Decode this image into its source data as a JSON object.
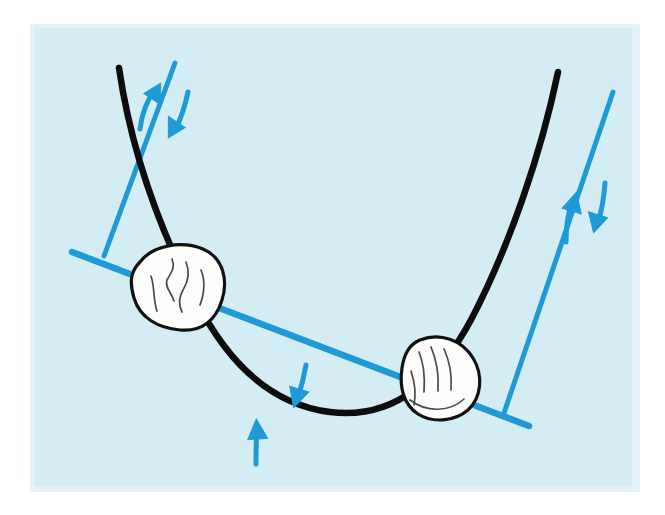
{
  "figure": {
    "title": "Hand-drawn diagram of a bead on a curved wire with two straight guide lines",
    "kind": "hand-drawn-geometry-sketch",
    "canvas": {
      "width": 665,
      "height": 515
    },
    "colors": {
      "page_background": "#ffffff",
      "panel_background": "#d7eef5",
      "curve_stroke": "#0d0d0d",
      "line_stroke": "#1f9ad6",
      "arrow_fill": "#1f9ad6",
      "bead_fill": "#fdfdfb",
      "bead_stroke": "#111111",
      "bead_detail_stroke": "#4a4a4a"
    },
    "panel": {
      "name": "paper-panel",
      "x": 30,
      "y": 24,
      "width": 610,
      "height": 468
    },
    "curve": {
      "name": "parabola-wire",
      "description": "U-shaped black curve, steep arms on both sides, vertex near bottom centre",
      "stroke_width": 6,
      "left_top_point": [
        119,
        68
      ],
      "vertex_point": [
        330,
        413
      ],
      "right_top_point": [
        558,
        72
      ],
      "path": "M 119 68 C 131 150, 160 230, 196 300 C 226 360, 268 404, 330 412 C 392 420, 438 382, 472 318 C 510 245, 542 150, 558 72"
    },
    "lines": [
      {
        "name": "left-guide-line",
        "description": "short blue straight line crossing the left arm of the curve",
        "x1": 175,
        "y1": 63,
        "x2": 104,
        "y2": 256,
        "stroke_width": 5
      },
      {
        "name": "chord-line",
        "description": "long blue straight line running from upper-left down to lower-right, passing through both beads",
        "x1": 72,
        "y1": 252,
        "x2": 529,
        "y2": 426,
        "stroke_width": 6
      },
      {
        "name": "right-guide-line",
        "description": "blue straight line crossing the right arm of the curve",
        "x1": 613,
        "y1": 92,
        "x2": 503,
        "y2": 416,
        "stroke_width": 5
      }
    ],
    "beads": [
      {
        "name": "bead-left",
        "description": "white rounded blob sitting where the chord line crosses the left arm of the curve",
        "center": [
          177,
          288
        ],
        "rx": 44,
        "ry": 38,
        "rotation": -12,
        "outline": "M 140 262 C 152 246, 180 240, 203 249 C 224 258, 228 281, 222 300 C 216 320, 202 332, 180 330 C 158 328, 140 318, 134 298 C 129 281, 131 271, 140 262 Z",
        "detail_strokes": [
          "M 172 259 C 176 268, 170 274, 167 280 C 164 287, 172 293, 174 301",
          "M 186 262 C 190 272, 188 282, 183 290 C 179 297, 178 304, 182 312",
          "M 151 276 C 155 288, 153 300, 157 311",
          "M 200 271 C 205 283, 203 295, 199 306"
        ]
      },
      {
        "name": "bead-right",
        "description": "white rounded blob with finger-like internal lines sitting where the chord line crosses the right arm of the curve",
        "center": [
          441,
          377
        ],
        "rx": 40,
        "ry": 42,
        "rotation": 18,
        "outline": "M 420 340 C 440 332, 462 340, 473 358 C 484 376, 481 398, 468 410 C 454 422, 432 423, 418 414 C 404 405, 399 388, 402 368 C 404 354, 410 344, 420 340 Z",
        "detail_strokes": [
          "M 419 352 C 424 364, 425 378, 424 392",
          "M 431 348 C 437 361, 439 376, 438 391",
          "M 444 349 C 450 362, 452 377, 451 390",
          "M 412 372 C 416 384, 417 396, 415 406",
          "M 411 401 C 427 413, 450 412, 464 400"
        ]
      }
    ],
    "arrows": [
      {
        "name": "arrow-top-left-up",
        "direction": "up-left",
        "description": "blue curved arrow beside the left guide line pointing up toward the top of the line",
        "path": "M 140 127 C 142 112, 147 99, 156 88",
        "tip": [
          156,
          86
        ],
        "angle_deg": -52,
        "stroke_width": 5
      },
      {
        "name": "arrow-top-left-down",
        "direction": "down-right",
        "description": "blue curved arrow beside the left guide line pointing down away from the top of the line",
        "path": "M 187 92 C 184 106, 180 119, 174 131",
        "tip": [
          173,
          134
        ],
        "angle_deg": 118,
        "stroke_width": 5
      },
      {
        "name": "arrow-bottom-centre-down",
        "direction": "down",
        "description": "blue arrow above the vertex of the curve pointing down onto the curve",
        "path": "M 305 366 C 303 377, 300 388, 297 398",
        "tip": [
          296,
          402
        ],
        "angle_deg": 104,
        "stroke_width": 5
      },
      {
        "name": "arrow-bottom-centre-up",
        "direction": "up",
        "description": "blue arrow below the curve pointing up toward the curve",
        "path": "M 256 461 C 256 449, 256 438, 257 428",
        "tip": [
          257,
          424
        ],
        "angle_deg": -84,
        "stroke_width": 5
      },
      {
        "name": "arrow-top-right-up",
        "direction": "up-left",
        "description": "blue curved arrow beside the right guide line pointing up toward the top of the line",
        "path": "M 566 240 C 566 226, 568 212, 573 200",
        "tip": [
          574,
          196
        ],
        "angle_deg": -68,
        "stroke_width": 5
      },
      {
        "name": "arrow-top-right-down",
        "direction": "down-right",
        "description": "blue curved arrow beside the right guide line pointing down away from the top of the line",
        "path": "M 604 184 C 603 198, 601 211, 597 224",
        "tip": [
          596,
          228
        ],
        "angle_deg": 103,
        "stroke_width": 5
      }
    ]
  }
}
